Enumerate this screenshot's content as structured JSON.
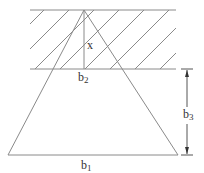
{
  "diagram": {
    "title": "",
    "labels": {
      "x": "x",
      "b2": {
        "base": "b",
        "sub": "2"
      },
      "b3": {
        "base": "b",
        "sub": "3"
      },
      "b1": {
        "base": "b",
        "sub": "1"
      }
    },
    "colors": {
      "line": "#8a8a8a",
      "text": "#333333",
      "background": "#ffffff"
    },
    "elements": [
      "hatched-band",
      "triangle",
      "height-line-x",
      "dimension-arrow-b3"
    ]
  }
}
